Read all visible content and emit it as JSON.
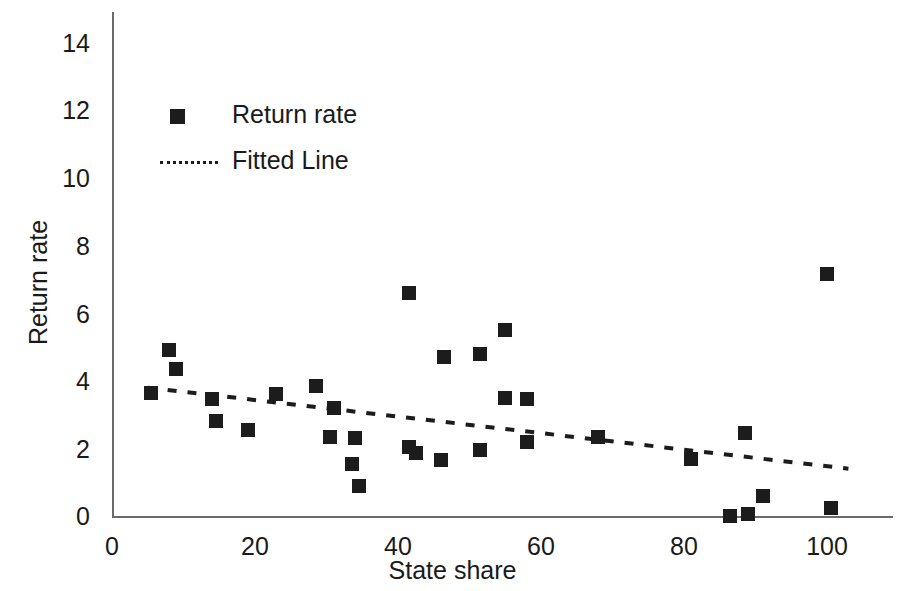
{
  "chart_data": {
    "type": "scatter",
    "title": "",
    "xlabel": "State share",
    "ylabel": "Return rate",
    "xlim": [
      0,
      110
    ],
    "ylim": [
      0,
      15
    ],
    "xticks": [
      "0",
      "20",
      "40",
      "60",
      "80",
      "100"
    ],
    "xtick_values": [
      0,
      20,
      40,
      60,
      80,
      100
    ],
    "yticks": [
      "0",
      "2",
      "4",
      "6",
      "8",
      "10",
      "12",
      "14"
    ],
    "ytick_values": [
      0,
      2,
      4,
      6,
      8,
      10,
      12,
      14
    ],
    "grid": false,
    "legend_position": "upper left",
    "series": [
      {
        "name": "Return rate",
        "type": "scatter",
        "marker": "square",
        "color": "#1c1c1c",
        "points": [
          [
            5.5,
            3.65
          ],
          [
            8.0,
            4.9
          ],
          [
            9.0,
            4.35
          ],
          [
            14.0,
            3.45
          ],
          [
            14.5,
            2.8
          ],
          [
            19.0,
            2.55
          ],
          [
            23.0,
            3.6
          ],
          [
            28.5,
            3.85
          ],
          [
            30.5,
            2.35
          ],
          [
            31.0,
            3.2
          ],
          [
            33.5,
            1.55
          ],
          [
            34.0,
            2.3
          ],
          [
            34.5,
            0.9
          ],
          [
            41.5,
            6.6
          ],
          [
            41.5,
            2.05
          ],
          [
            42.5,
            1.85
          ],
          [
            46.0,
            1.65
          ],
          [
            46.5,
            4.7
          ],
          [
            51.5,
            4.8
          ],
          [
            51.5,
            1.95
          ],
          [
            55.0,
            5.5
          ],
          [
            55.0,
            3.5
          ],
          [
            58.0,
            3.45
          ],
          [
            58.0,
            2.2
          ],
          [
            68.0,
            2.35
          ],
          [
            81.0,
            1.7
          ],
          [
            86.5,
            0.0
          ],
          [
            88.5,
            2.45
          ],
          [
            89.0,
            0.05
          ],
          [
            91.0,
            0.6
          ],
          [
            100.0,
            7.15
          ],
          [
            100.5,
            0.25
          ]
        ]
      },
      {
        "name": "Fitted Line",
        "type": "line",
        "style": "dotted",
        "color": "#1c1c1c",
        "endpoints": [
          [
            5.0,
            3.8
          ],
          [
            103.0,
            1.4
          ]
        ]
      }
    ]
  },
  "legend": {
    "items": [
      {
        "label": "Return rate",
        "icon": "square-marker"
      },
      {
        "label": "Fitted Line",
        "icon": "dotted-line"
      }
    ]
  }
}
